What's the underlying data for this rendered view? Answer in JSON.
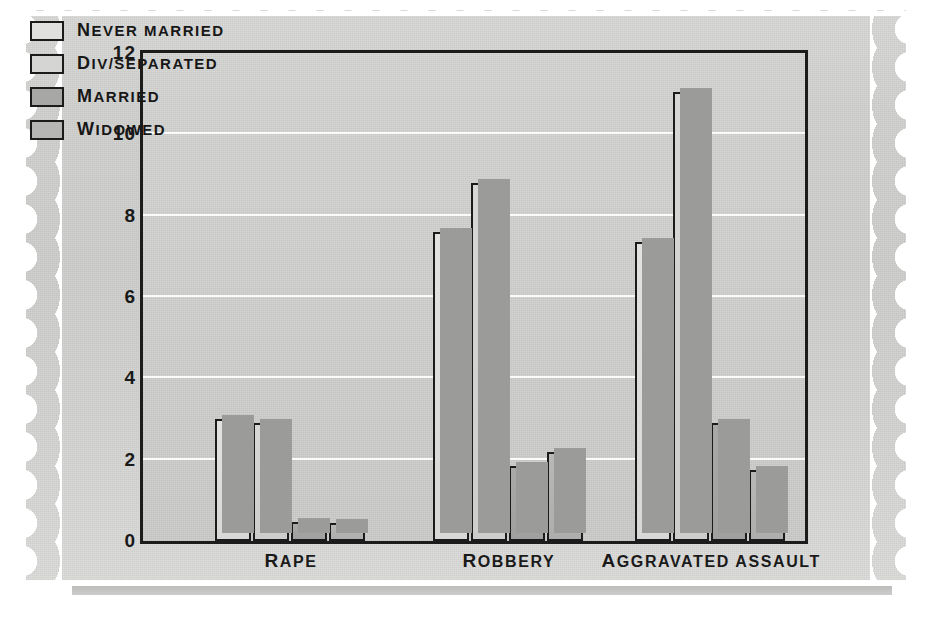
{
  "chart_data": {
    "type": "bar",
    "title": "",
    "xlabel": "",
    "ylabel": "",
    "ylim": [
      0,
      12
    ],
    "yticks": [
      0,
      2,
      4,
      6,
      8,
      10,
      12
    ],
    "ytick_labels": [
      "0",
      "2",
      "4",
      "6",
      "8",
      "10",
      "12"
    ],
    "grid": "horizontal",
    "gridlines_at": [
      2,
      4,
      6,
      8,
      10
    ],
    "legend_position": "top-left",
    "categories": [
      "Rape",
      "Robbery",
      "Aggravated assault"
    ],
    "series": [
      {
        "name": "Never married",
        "values": [
          3.0,
          7.6,
          7.35
        ]
      },
      {
        "name": "Div/separated",
        "values": [
          2.9,
          8.8,
          11.05
        ]
      },
      {
        "name": "Married",
        "values": [
          0.47,
          1.85,
          2.9
        ]
      },
      {
        "name": "Widowed",
        "values": [
          0.45,
          2.2,
          1.75
        ]
      }
    ],
    "series_colors": [
      "#e0e0de",
      "#d5d5d3",
      "#a7a7a5",
      "#b6b6b4"
    ]
  },
  "axis": {
    "y_labels": [
      "12",
      "10",
      "8",
      "6",
      "4",
      "2",
      "0"
    ]
  },
  "legend": {
    "items": [
      {
        "label": "Never married",
        "first": "N",
        "rest": "EVER MARRIED"
      },
      {
        "label": "Div/separated",
        "first": "D",
        "rest": "IV/SEPARATED"
      },
      {
        "label": "Married",
        "first": "M",
        "rest": "ARRIED"
      },
      {
        "label": "Widowed",
        "first": "W",
        "rest": "IDOWED"
      }
    ]
  },
  "x_axis": {
    "categories": [
      {
        "label": "Rape",
        "first": "R",
        "rest": "APE"
      },
      {
        "label": "Robbery",
        "first": "R",
        "rest": "OBBERY"
      },
      {
        "label": "Aggravated assault",
        "first": "A",
        "rest": "GGRAVATED ASSAULT"
      }
    ]
  }
}
